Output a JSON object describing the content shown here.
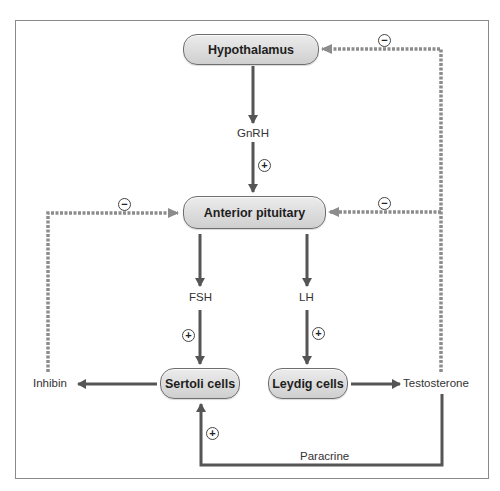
{
  "diagram": {
    "colors": {
      "solid_arrow": "#555555",
      "dashed_arrow": "#8c8c8c",
      "node_fill": "#dcdcdc",
      "node_border": "#6e6e6e",
      "frame": "#8a8a8a"
    },
    "nodes": {
      "hypothalamus": "Hypothalamus",
      "anterior_pituitary": "Anterior pituitary",
      "sertoli": "Sertoli cells",
      "leydig": "Leydig cells"
    },
    "labels": {
      "gnrh": "GnRH",
      "fsh": "FSH",
      "lh": "LH",
      "inhibin": "Inhibin",
      "testosterone": "Testosterone",
      "paracrine": "Paracrine"
    },
    "signs": {
      "plus": "+",
      "minus": "−"
    },
    "edges": [
      {
        "from": "Hypothalamus",
        "to": "Anterior pituitary",
        "via": "GnRH",
        "effect": "+",
        "style": "solid"
      },
      {
        "from": "Anterior pituitary",
        "to": "Sertoli cells",
        "via": "FSH",
        "effect": "+",
        "style": "solid"
      },
      {
        "from": "Anterior pituitary",
        "to": "Leydig cells",
        "via": "LH",
        "effect": "+",
        "style": "solid"
      },
      {
        "from": "Sertoli cells",
        "to": "Inhibin",
        "style": "solid"
      },
      {
        "from": "Leydig cells",
        "to": "Testosterone",
        "style": "solid"
      },
      {
        "from": "Inhibin",
        "to": "Anterior pituitary",
        "effect": "−",
        "style": "dashed"
      },
      {
        "from": "Testosterone",
        "to": "Anterior pituitary",
        "effect": "−",
        "style": "dashed"
      },
      {
        "from": "Testosterone",
        "to": "Hypothalamus",
        "effect": "−",
        "style": "dashed"
      },
      {
        "from": "Testosterone",
        "to": "Sertoli cells",
        "via": "Paracrine",
        "effect": "+",
        "style": "solid"
      }
    ]
  }
}
